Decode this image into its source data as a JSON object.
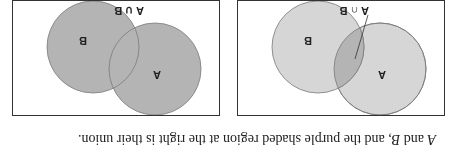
{
  "caption": {
    "var_a": "A",
    "text_mid": " and ",
    "var_b": "B",
    "text_end": ", and the purple shaded region at the right is their union."
  },
  "panels": [
    {
      "id": "intersection",
      "set_a_label": "A",
      "set_b_label": "B",
      "operation_label": "A ∩ B",
      "shaded_region": "intersection"
    },
    {
      "id": "union",
      "set_a_label": "A",
      "set_b_label": "B",
      "operation_label": "A ∪ B",
      "shaded_region": "union"
    }
  ],
  "colors": {
    "light_fill": "#d6d6d6",
    "shaded_fill": "#b4b4b4",
    "stroke": "#7a7a7a",
    "border": "#333333"
  },
  "orientation": "rotated 180 degrees"
}
